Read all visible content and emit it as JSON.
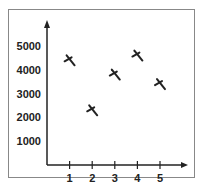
{
  "chart_data": {
    "type": "scatter",
    "title": "",
    "xlabel": "",
    "ylabel": "",
    "x": [
      1,
      2,
      3,
      4,
      5
    ],
    "values": [
      4400,
      2300,
      3800,
      4600,
      3400
    ],
    "x_ticks": [
      "1",
      "2",
      "3",
      "4",
      "5"
    ],
    "y_ticks": [
      "1000",
      "2000",
      "3000",
      "4000",
      "5000"
    ],
    "ylim": [
      0,
      5500
    ],
    "xlim": [
      0,
      6
    ],
    "grid": false,
    "marker": "x"
  }
}
